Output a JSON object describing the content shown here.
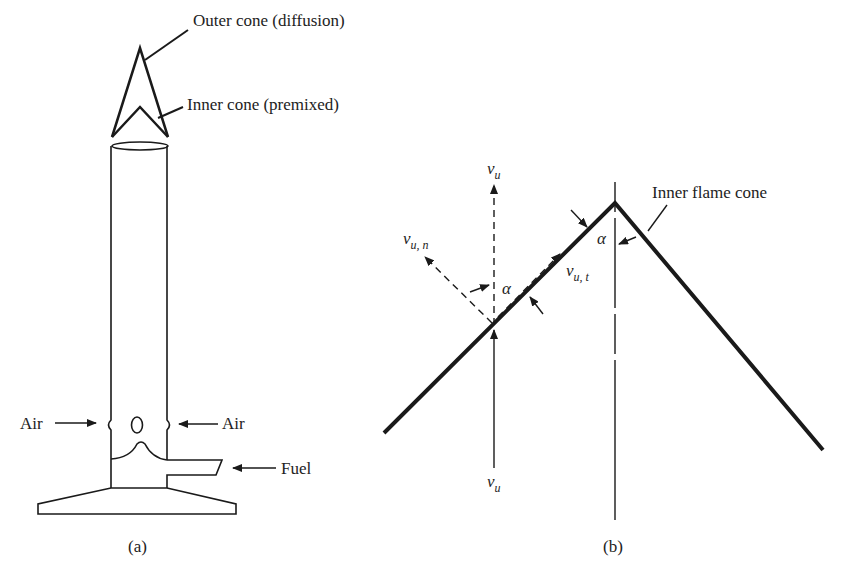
{
  "panel_a": {
    "caption": "(a)",
    "outer_cone_label": "Outer cone (diffusion)",
    "inner_cone_label": "Inner cone (premixed)",
    "air_left_label": "Air",
    "air_right_label": "Air",
    "fuel_label": "Fuel"
  },
  "panel_b": {
    "caption": "(b)",
    "cone_label": "Inner flame cone",
    "vu_top": {
      "main": "v",
      "sub": "u"
    },
    "vu_bottom": {
      "main": "v",
      "sub": "u"
    },
    "vun": {
      "main": "v",
      "sub": "u, n"
    },
    "vut": {
      "main": "v",
      "sub": "u, t"
    },
    "alpha_left": "α",
    "alpha_right": "α"
  },
  "colors": {
    "ink": "#1a1a1a"
  }
}
